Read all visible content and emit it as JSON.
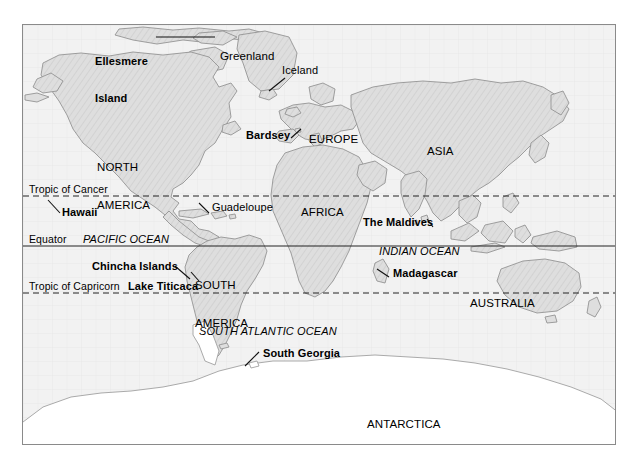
{
  "figure": {
    "kind": "world-map",
    "projection_note": "equirectangular world map, hatched land fill",
    "background_color": "#ffffff",
    "map_background_color": "#f2f2f2",
    "land_fill_color": "#dcdcdc",
    "land_outline_color": "#8f8f8f",
    "frame_color": "#8a8a8a",
    "text_color": "#000000"
  },
  "latitude_lines": [
    {
      "id": "tropic-of-cancer",
      "label": "Tropic of Cancer",
      "style": "dashed",
      "y": 171,
      "label_x": 6,
      "label_y": 159
    },
    {
      "id": "equator",
      "label": "Equator",
      "style": "solid",
      "y": 221,
      "label_x": 6,
      "label_y": 209
    },
    {
      "id": "tropic-of-capricorn",
      "label": "Tropic of Capricorn",
      "style": "dashed",
      "y": 268,
      "label_x": 6,
      "label_y": 256
    }
  ],
  "continents": [
    {
      "id": "north-america",
      "label": "NORTH\nAMERICA",
      "line1": "NORTH",
      "line2": "AMERICA",
      "x": 74,
      "y": 110,
      "weight": "regular",
      "size": 11.5
    },
    {
      "id": "south-america",
      "label": "SOUTH\nAMERICA",
      "line1": "SOUTH",
      "line2": "AMERICA",
      "x": 172,
      "y": 228,
      "weight": "regular",
      "size": 11.5
    },
    {
      "id": "europe",
      "label": "EUROPE",
      "x": 286,
      "y": 108,
      "weight": "regular",
      "size": 11.5
    },
    {
      "id": "africa",
      "label": "AFRICA",
      "x": 278,
      "y": 181,
      "weight": "regular",
      "size": 11.5
    },
    {
      "id": "asia",
      "label": "ASIA",
      "x": 404,
      "y": 120,
      "weight": "regular",
      "size": 11.5
    },
    {
      "id": "australia",
      "label": "AUSTRALIA",
      "x": 447,
      "y": 272,
      "weight": "regular",
      "size": 11.5
    },
    {
      "id": "antarctica",
      "label": "ANTARCTICA",
      "x": 344,
      "y": 393,
      "weight": "regular",
      "size": 11.5
    },
    {
      "id": "greenland",
      "label": "Greenland",
      "x": 197,
      "y": 25,
      "weight": "regular",
      "size": 11.5
    }
  ],
  "oceans": [
    {
      "id": "pacific-ocean",
      "label": "PACIFIC OCEAN",
      "x": 60,
      "y": 209,
      "style": "italic",
      "size": 11
    },
    {
      "id": "indian-ocean",
      "label": "INDIAN OCEAN",
      "x": 356,
      "y": 221,
      "style": "italic",
      "size": 11
    },
    {
      "id": "south-atlantic-ocean",
      "label": "SOUTH ATLANTIC OCEAN",
      "x": 176,
      "y": 301,
      "style": "italic",
      "size": 11
    }
  ],
  "place_labels": [
    {
      "id": "ellesmere-island",
      "label": "Ellesmere\nIsland",
      "line1": "Ellesmere",
      "line2": "Island",
      "x": 72,
      "y": 5,
      "weight": "bold",
      "size": 11,
      "leader": {
        "type": "horizontal",
        "x": 133,
        "y": 12,
        "length": 59
      }
    },
    {
      "id": "iceland",
      "label": "Iceland",
      "x": 259,
      "y": 40,
      "weight": "regular",
      "size": 11,
      "leader": {
        "type": "diagonal",
        "x1": 262,
        "y1": 53,
        "x2": 246,
        "y2": 66
      }
    },
    {
      "id": "bardsey",
      "label": "Bardsey",
      "x": 223,
      "y": 105,
      "weight": "bold",
      "size": 11,
      "leader": {
        "type": "diagonal",
        "x1": 268,
        "y1": 113,
        "x2": 278,
        "y2": 104
      }
    },
    {
      "id": "hawaii",
      "label": "Hawaii",
      "x": 39,
      "y": 182,
      "weight": "bold",
      "size": 11,
      "leader": {
        "type": "diagonal",
        "x1": 37,
        "y1": 188,
        "x2": 25,
        "y2": 175
      }
    },
    {
      "id": "guadeloupe",
      "label": "Guadeloupe",
      "x": 189,
      "y": 177,
      "weight": "regular",
      "size": 11,
      "leader": {
        "type": "diagonal",
        "x1": 186,
        "y1": 188,
        "x2": 176,
        "y2": 178
      }
    },
    {
      "id": "the-maldives",
      "label": "The Maldives",
      "x": 340,
      "y": 192,
      "weight": "bold",
      "size": 11,
      "leader": {
        "type": "diagonal",
        "x1": 410,
        "y1": 202,
        "x2": 404,
        "y2": 194
      }
    },
    {
      "id": "chincha-islands",
      "label": "Chincha Islands",
      "x": 69,
      "y": 236,
      "weight": "bold",
      "size": 11,
      "leader": {
        "type": "diagonal",
        "x1": 152,
        "y1": 241,
        "x2": 167,
        "y2": 254
      }
    },
    {
      "id": "lake-titicaca",
      "label": "Lake Titicaca",
      "x": 105,
      "y": 256,
      "weight": "bold",
      "size": 11,
      "leader": {
        "type": "diagonal",
        "x1": 176,
        "y1": 256,
        "x2": 168,
        "y2": 248
      }
    },
    {
      "id": "madagascar",
      "label": "Madagascar",
      "x": 370,
      "y": 243,
      "weight": "bold",
      "size": 11,
      "leader": {
        "type": "diagonal",
        "x1": 366,
        "y1": 252,
        "x2": 354,
        "y2": 244
      }
    },
    {
      "id": "south-georgia",
      "label": "South Georgia",
      "x": 240,
      "y": 323,
      "weight": "bold",
      "size": 11,
      "leader": {
        "type": "diagonal",
        "x1": 236,
        "y1": 327,
        "x2": 222,
        "y2": 340
      }
    }
  ]
}
